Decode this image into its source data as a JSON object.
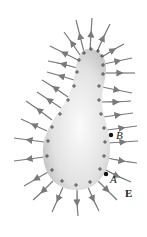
{
  "diagram": {
    "colors": {
      "conductor_light": "#f4f4f4",
      "conductor_dark": "#c8c8c8",
      "field_line": "#7a7a7a",
      "charge": "#333333",
      "point": "#111111"
    },
    "labels": {
      "point_a": "A",
      "point_b": "B",
      "field": "E"
    },
    "charge_symbol": "+",
    "points": [
      {
        "name": "A",
        "x": 106,
        "y": 174
      },
      {
        "name": "B",
        "x": 111,
        "y": 135
      }
    ]
  }
}
